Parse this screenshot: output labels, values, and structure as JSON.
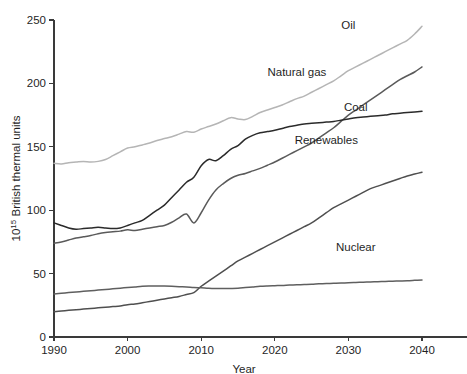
{
  "chart_data": {
    "type": "line",
    "title": "",
    "xlabel": "Year",
    "ylabel": "10^15 British thermal units",
    "ylabel_base": "10",
    "ylabel_exponent": "15",
    "ylabel_rest": " British thermal units",
    "xlim": [
      1990,
      2040
    ],
    "ylim": [
      0,
      250
    ],
    "xticks": [
      1990,
      2000,
      2010,
      2020,
      2030,
      2040
    ],
    "yticks": [
      0,
      50,
      100,
      150,
      200,
      250
    ],
    "grid": false,
    "legend_position": "inline-labels",
    "x": [
      1990,
      1991,
      1992,
      1993,
      1994,
      1995,
      1996,
      1997,
      1998,
      1999,
      2000,
      2001,
      2002,
      2003,
      2004,
      2005,
      2006,
      2007,
      2008,
      2009,
      2010,
      2011,
      2012,
      2013,
      2014,
      2015,
      2016,
      2017,
      2018,
      2019,
      2020,
      2021,
      2022,
      2023,
      2024,
      2025,
      2026,
      2027,
      2028,
      2029,
      2030,
      2031,
      2032,
      2033,
      2034,
      2035,
      2036,
      2037,
      2038,
      2039,
      2040
    ],
    "series": [
      {
        "name": "Oil",
        "label": "Oil",
        "color": "#b5b5b5",
        "values": [
          137,
          136.5,
          137.5,
          138,
          138.5,
          138,
          138.5,
          140,
          143,
          146,
          149,
          150,
          151.5,
          153,
          155,
          156.5,
          158,
          160,
          162,
          161.5,
          164,
          166,
          168,
          170.5,
          173,
          172,
          171.5,
          174,
          177,
          179,
          181,
          183,
          185.5,
          188,
          190,
          193,
          196,
          199,
          202,
          206,
          210,
          213,
          216,
          219,
          222,
          225,
          228,
          231,
          234,
          239,
          245
        ],
        "label_x": 2030,
        "label_y": 243
      },
      {
        "name": "Natural gas",
        "label": "Natural gas",
        "color": "#5a5a5a",
        "values": [
          74,
          75,
          76.5,
          78,
          79,
          80,
          81.5,
          82.5,
          83,
          83.5,
          84.5,
          84,
          85,
          86,
          87,
          88,
          90.5,
          94,
          97,
          90,
          98,
          108,
          116,
          121,
          125,
          127.5,
          129,
          131,
          133,
          135.5,
          138,
          141,
          144,
          147,
          150,
          153,
          157,
          161,
          165,
          170,
          175,
          179,
          183,
          187,
          191,
          195,
          199,
          203,
          206,
          209,
          213
        ],
        "label_x": 2023,
        "label_y": 206
      },
      {
        "name": "Coal",
        "label": "Coal",
        "color": "#2b2b2b",
        "values": [
          90,
          88,
          86,
          85,
          85.5,
          86,
          86.5,
          86,
          85.5,
          86,
          88,
          90,
          92,
          96,
          100,
          104,
          110,
          116,
          122,
          126,
          135,
          140,
          139,
          143,
          148,
          151,
          156,
          159,
          161,
          162,
          163,
          164.5,
          166,
          167,
          168,
          168.5,
          169,
          169.5,
          170,
          171,
          172,
          173,
          173.5,
          174,
          174.5,
          175,
          176,
          176.5,
          177,
          177.5,
          178
        ],
        "label_x": 2031,
        "label_y": 178
      },
      {
        "name": "Renewables",
        "label": "Renewables",
        "color": "#4f4f4f",
        "values": [
          20,
          20.5,
          21,
          21.5,
          22,
          22.5,
          23,
          23.5,
          24,
          24.5,
          25.5,
          26,
          27,
          28,
          29,
          30,
          31,
          32,
          33.5,
          35,
          40,
          44,
          48,
          52,
          56,
          60,
          63,
          66,
          69,
          72,
          75,
          78,
          81,
          84,
          87,
          90,
          94,
          98,
          102,
          105,
          108,
          111,
          114,
          117,
          119,
          121,
          123,
          125,
          127,
          128.5,
          130
        ],
        "label_x": 2027,
        "label_y": 152
      },
      {
        "name": "Nuclear",
        "label": "Nuclear",
        "color": "#5f5f5f",
        "values": [
          34,
          34.5,
          35,
          35.5,
          36,
          36.5,
          37,
          37.5,
          38,
          38.5,
          39,
          39.5,
          40,
          40.2,
          40.3,
          40.2,
          40,
          39.7,
          39.5,
          39,
          38.8,
          38.5,
          38.3,
          38.2,
          38.3,
          38.5,
          39,
          39.5,
          40,
          40.3,
          40.5,
          40.7,
          41,
          41.2,
          41.4,
          41.6,
          41.9,
          42.1,
          42.3,
          42.5,
          42.8,
          43,
          43.2,
          43.4,
          43.6,
          43.8,
          44,
          44.2,
          44.4,
          44.7,
          45
        ],
        "label_x": 2031,
        "label_y": 68
      }
    ]
  }
}
